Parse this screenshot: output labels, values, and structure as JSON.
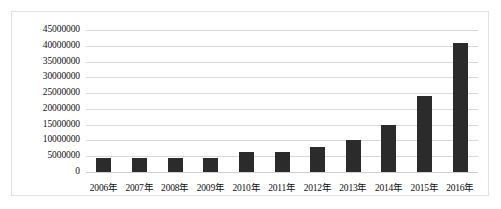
{
  "chart_data": {
    "type": "bar",
    "title": "",
    "xlabel": "",
    "ylabel": "",
    "grid": true,
    "legend": false,
    "ylim": [
      0,
      45000000
    ],
    "ytick_step": 5000000,
    "bar_color": "#2b2b2b",
    "gridline_color": "#d9d9d9",
    "border_color": "#e2e2e2",
    "categories": [
      "2006年",
      "2007年",
      "2008年",
      "2009年",
      "2010年",
      "2011年",
      "2012年",
      "2013年",
      "2014年",
      "2015年",
      "2016年"
    ],
    "values": [
      4500000,
      4500000,
      4600000,
      4600000,
      6300000,
      6300000,
      8000000,
      10300000,
      15000000,
      24000000,
      41000000
    ],
    "yticks": [
      "45000000",
      "40000000",
      "35000000",
      "30000000",
      "25000000",
      "20000000",
      "15000000",
      "10000000",
      "5000000",
      "0"
    ],
    "ytick_values": [
      45000000,
      40000000,
      35000000,
      30000000,
      25000000,
      20000000,
      15000000,
      10000000,
      5000000,
      0
    ]
  }
}
